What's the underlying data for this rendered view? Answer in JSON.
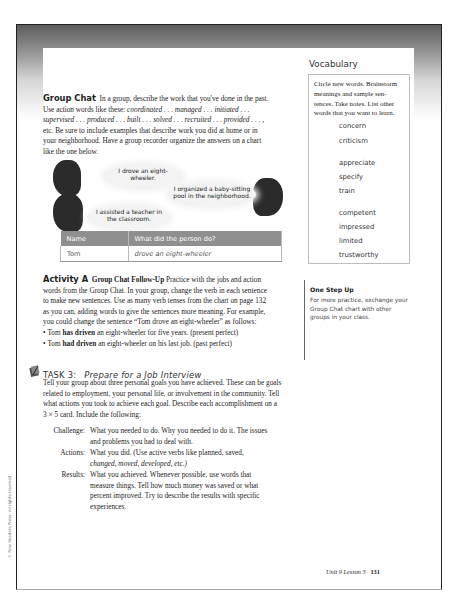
{
  "group_chat": {
    "title": "Group Chat",
    "intro": "In a group, describe the work that you've done in the past.",
    "line2_prefix": "Use action words like these: ",
    "line2_words": "coordinated . . . managed . . . initiated . . .",
    "line3_words": "supervised . . . produced . . . built . . . solved . . . recruited . . . provided . . . ,",
    "line4": "etc. Be sure to include examples that describe work you did at home or in",
    "line5": "your neighborhood. Have a group recorder organize the answers on a chart",
    "line6": "like the one below."
  },
  "illustration": {
    "bubbles": [
      {
        "line1": "I drove an eight-",
        "line2": "wheeler."
      },
      {
        "line1": "I organized a baby-sitting",
        "line2": "pool in the neighborhood."
      },
      {
        "line1": "I assisted a teacher in",
        "line2": "the classroom."
      }
    ]
  },
  "chart_table": {
    "headers": [
      "Name",
      "What did the person do?"
    ],
    "rows": [
      [
        "Tom",
        "drove an eight-wheeler"
      ]
    ]
  },
  "vocabulary": {
    "heading": "Vocabulary",
    "instructions": [
      "Circle new words. Brainstorm",
      "meanings and sample sen-",
      "tences. Take notes. List other",
      "words that you want to learn."
    ],
    "groups": [
      [
        "concern",
        "criticism"
      ],
      [
        "appreciate",
        "specify",
        "train"
      ],
      [
        "competent",
        "impressed",
        "limited",
        "trustworthy"
      ]
    ]
  },
  "one_step_up": {
    "title": "One Step Up",
    "lines": [
      "For more practice, exchange your",
      "Group Chat chart with other",
      "groups in your class."
    ]
  },
  "activity_a": {
    "label": "Activity A",
    "subtitle": "Group Chat Follow-Up",
    "line1_rest": " Practice with the jobs and action",
    "line2": "words from the Group Chat. In your group, change the verb in each sentence",
    "line3": "to make new sentences. Use as many verb tenses from the chart on page 132",
    "line4": "as you can, adding words to give the sentences more meaning. For example,",
    "line5": "you could change the sentence “Tom drove an eight-wheeler” as follows:",
    "bullets": [
      {
        "pre": "Tom ",
        "bold": "has driven",
        "post": " an eight-wheeler for five years. (present perfect)"
      },
      {
        "pre": "Tom ",
        "bold": "had driven",
        "post": " an eight-wheeler on his last job. (past perfect)"
      }
    ]
  },
  "task3": {
    "number": "TASK 3:",
    "title": "Prepare for a Job Interview",
    "lines": [
      "Tell your group about three personal goals you have achieved. These can be goals",
      "related to employment, your personal life, or involvement in the community. Tell",
      "what actions you took to achieve each goal. Describe each accomplishment on a",
      "3 × 5 card. Include the following:"
    ],
    "items": [
      {
        "label": "Challenge:",
        "lines": [
          "What you needed to do. Why you needed to do it. The issues",
          "and problems you had to deal with."
        ]
      },
      {
        "label": "Actions:",
        "lines": [
          "What you did. (Use active verbs like planned, saved,",
          "changed, moved, developed, etc.)"
        ]
      },
      {
        "label": "Results:",
        "lines": [
          "What you achieved. Whenever possible, use words that",
          "measure things. Tell how much money was saved or what",
          "percent improved. Try to describe the results with specific",
          "experiences."
        ]
      }
    ]
  },
  "copyright": "© New Readers Press. All rights reserved.",
  "footer": {
    "lesson": "Unit 9 Lesson 3",
    "page": "131"
  }
}
